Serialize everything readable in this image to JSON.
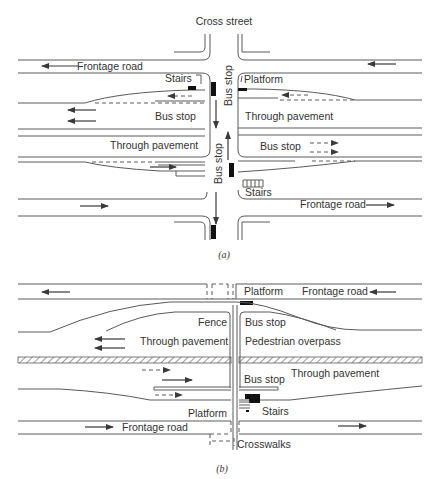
{
  "diagram_a": {
    "caption": "(a)",
    "labels": {
      "cross_street": "Cross street",
      "frontage_road_top": "Frontage road",
      "frontage_road_bottom": "Frontage road",
      "stairs_top": "Stairs",
      "stairs_bottom": "Stairs",
      "platform": "Platform",
      "bus_stop_left": "Bus stop",
      "bus_stop_right": "Bus stop",
      "bus_stop_vertical_top": "Bus stop",
      "bus_stop_vertical_bottom": "Bus stop",
      "through_pavement_left": "Through pavement",
      "through_pavement_right": "Through pavement"
    }
  },
  "diagram_b": {
    "caption": "(b)",
    "labels": {
      "platform_top": "Platform",
      "platform_bottom": "Platform",
      "frontage_road_top": "Frontage road",
      "frontage_road_bottom": "Frontage road",
      "fence": "Fence",
      "bus_stop_top": "Bus stop",
      "bus_stop_bottom": "Bus stop",
      "through_pavement_left": "Through pavement",
      "through_pavement_right": "Through pavement",
      "pedestrian_overpass": "Pedestrian overpass",
      "stairs": "Stairs",
      "crosswalks": "Crosswalks"
    }
  }
}
